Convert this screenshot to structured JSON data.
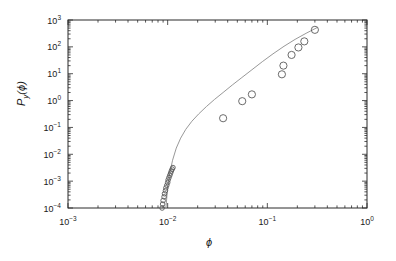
{
  "figure": {
    "background": "#ffffff",
    "frame_color": "#2b2b2b",
    "curve_color": "#8c8c8c",
    "marker_color": "#5a5a5a"
  },
  "axes": {
    "x_label": "ϕ",
    "y_label_base": "P",
    "y_label_sub": "y",
    "y_label_arg": "(ϕ)",
    "x_ticks": [
      "10⁻³",
      "10⁻²",
      "10⁻¹",
      "10⁰"
    ],
    "y_ticks": [
      "10³",
      "10²",
      "10¹",
      "10⁰",
      "10⁻¹",
      "10⁻²",
      "10⁻³",
      "10⁻⁴"
    ]
  },
  "chart_data": {
    "type": "scatter",
    "title": "",
    "xlabel": "ϕ",
    "ylabel": "P_y(ϕ)",
    "xscale": "log",
    "yscale": "log",
    "xlim": [
      0.001,
      1.0
    ],
    "ylim": [
      0.0001,
      1000.0
    ],
    "grid": false,
    "legend": false,
    "series": [
      {
        "name": "data",
        "marker": "open-circle",
        "x": [
          0.0088,
          0.0089,
          0.009,
          0.0092,
          0.0093,
          0.0095,
          0.0096,
          0.0098,
          0.01,
          0.0101,
          0.0103,
          0.0105,
          0.0107,
          0.0109,
          0.0111,
          0.0113,
          0.036,
          0.056,
          0.07,
          0.14,
          0.145,
          0.175,
          0.205,
          0.235,
          0.3
        ],
        "y": [
          0.0001,
          0.00014,
          0.00019,
          0.00026,
          0.00034,
          0.00044,
          0.00056,
          0.0007,
          0.00088,
          0.0011,
          0.00135,
          0.00165,
          0.002,
          0.0024,
          0.0028,
          0.0032,
          0.22,
          0.95,
          1.7,
          9.5,
          20.0,
          50.0,
          95.0,
          160.0,
          430.0
        ]
      },
      {
        "name": "model-fit",
        "type": "line",
        "x": [
          0.0096,
          0.01,
          0.0105,
          0.0112,
          0.0122,
          0.0135,
          0.0152,
          0.0175,
          0.0205,
          0.0245,
          0.0295,
          0.036,
          0.0445,
          0.0555,
          0.07,
          0.089,
          0.114,
          0.147,
          0.19,
          0.245,
          0.315
        ],
        "y": [
          0.0001,
          0.0006,
          0.002,
          0.006,
          0.017,
          0.04,
          0.085,
          0.17,
          0.32,
          0.6,
          1.1,
          2.0,
          3.8,
          7.2,
          14.0,
          28.0,
          55.0,
          105.0,
          190.0,
          320.0,
          520.0
        ]
      }
    ]
  }
}
